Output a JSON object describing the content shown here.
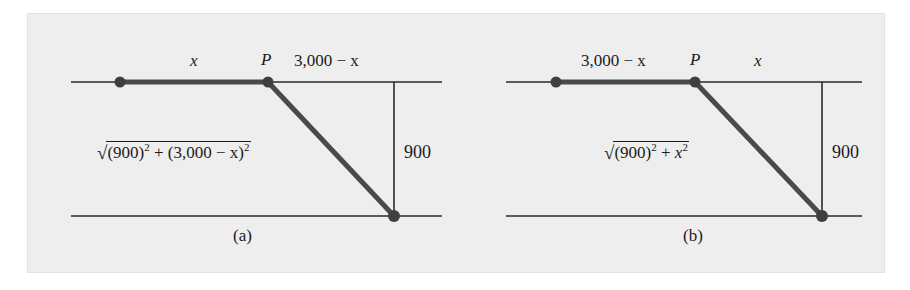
{
  "figure": {
    "background_color": "#ffffff",
    "panel_color": "#eeeeee",
    "ink_color": "#1b1b1b",
    "accent_color": "#4a4a4a"
  },
  "panels": [
    {
      "caption": "(a)",
      "point_label": "P",
      "top_left_segment_label": "x",
      "top_right_segment_label": "3,000 − x",
      "vertical_label": "900",
      "hypotenuse_expression": {
        "radical_glyph": "√",
        "term1_base": "(900)",
        "term1_exp": "2",
        "operator": "+",
        "term2_base": "(3,000 − x)",
        "term2_exp": "2",
        "plain": "√(900)² + (3,000 − x)²"
      }
    },
    {
      "caption": "(b)",
      "point_label": "P",
      "top_left_segment_label": "3,000 − x",
      "top_right_segment_label": "x",
      "vertical_label": "900",
      "hypotenuse_expression": {
        "radical_glyph": "√",
        "term1_base": "(900)",
        "term1_exp": "2",
        "operator": "+",
        "term2_base": "x",
        "term2_exp": "2",
        "plain": "√(900)² + x²"
      }
    }
  ]
}
